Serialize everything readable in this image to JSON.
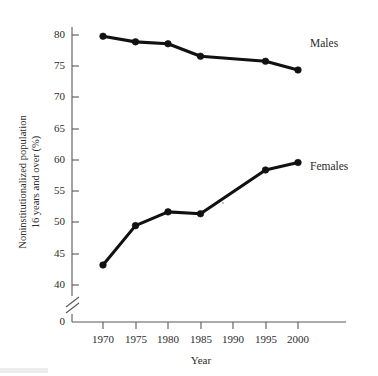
{
  "chart_data": {
    "type": "line",
    "title": "",
    "xlabel": "Year",
    "ylabel": "Noninstitutionalized population 16 years and over (%)",
    "ylabel_line1": "Noninstitutionalized population",
    "ylabel_line2": "16 years and over (%)",
    "x": [
      1970,
      1975,
      1980,
      1985,
      1995,
      2000
    ],
    "categories": [
      "1970",
      "1975",
      "1980",
      "1985",
      "1990",
      "1995",
      "2000"
    ],
    "xtick_labels": [
      "1970",
      "1975",
      "1980",
      "1985",
      "1990",
      "1995",
      "2000"
    ],
    "ytick_labels": [
      "0",
      "40",
      "45",
      "50",
      "55",
      "60",
      "65",
      "70",
      "75",
      "80"
    ],
    "ylim": [
      38,
      82
    ],
    "xlim": [
      1968,
      2002
    ],
    "axis_break": true,
    "axis_break_note": "y-axis broken between 0 and 40",
    "grid": false,
    "legend_position": "right-inline",
    "series": [
      {
        "name": "Males",
        "label": "Males",
        "color": "#111111",
        "x": [
          1970,
          1975,
          1980,
          1985,
          1995,
          2000
        ],
        "values": [
          79.8,
          78.9,
          78.6,
          76.6,
          75.8,
          74.4
        ]
      },
      {
        "name": "Females",
        "label": "Females",
        "color": "#111111",
        "x": [
          1970,
          1975,
          1980,
          1985,
          1995,
          2000
        ],
        "values": [
          43.2,
          49.5,
          51.7,
          51.4,
          58.4,
          59.6
        ]
      }
    ]
  }
}
